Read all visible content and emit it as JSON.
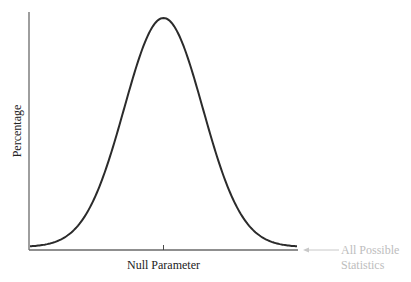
{
  "chart_data": {
    "type": "line",
    "title": "",
    "xlabel": "Null Parameter",
    "ylabel": "Percentage",
    "grid": false,
    "legend": "none",
    "distribution": "normal",
    "mean": 0,
    "sd": 1,
    "xlim": [
      -3.4,
      3.4
    ],
    "ylim": [
      0,
      1.03
    ],
    "x_ticks": [
      {
        "value": 0,
        "label": "Null Parameter"
      }
    ],
    "annotation": {
      "lines": [
        "All Possible",
        "Statistics"
      ],
      "points_to": "x-axis",
      "side": "right"
    }
  },
  "colors": {
    "curve": "#2b2b2b",
    "axis": "#6a6a6a",
    "annotation": "#bdbdbd"
  }
}
